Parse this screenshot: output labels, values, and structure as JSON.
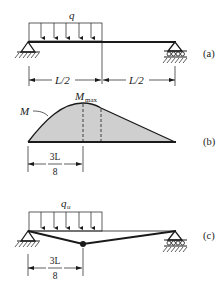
{
  "figure": {
    "panel_a": {
      "tag": "(a)",
      "load_label": "q",
      "dim_left": "L/2",
      "dim_right": "L/2",
      "left_support": "pin",
      "right_support": "roller"
    },
    "panel_b": {
      "tag": "(b)",
      "curve_label": "M",
      "peak_label_main": "M",
      "peak_label_sub": "max",
      "dim_num": "3L",
      "dim_den": "8"
    },
    "panel_c": {
      "tag": "(c)",
      "load_label_main": "q",
      "load_label_sub": "u",
      "dim_num": "3L",
      "dim_den": "8"
    },
    "colors": {
      "line": "#1a1a1a",
      "fill": "#cfcfcf"
    }
  }
}
